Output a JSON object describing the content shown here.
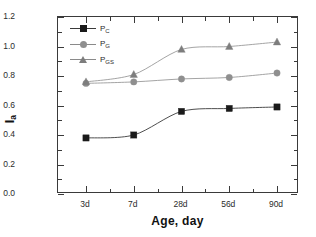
{
  "chart_data": {
    "type": "line",
    "title": "",
    "xlabel": "Age, day",
    "ylabel": "I",
    "ylabel_sub": "a",
    "categories": [
      "3d",
      "7d",
      "28d",
      "56d",
      "90d"
    ],
    "ylim": [
      0.0,
      1.2
    ],
    "ytick_labels": [
      "0.0",
      "0.2",
      "0.4",
      "0.6",
      "0.8",
      "1.0",
      "1.2"
    ],
    "ytick_values": [
      0.0,
      0.2,
      0.4,
      0.6,
      0.8,
      1.0,
      1.2
    ],
    "grid": false,
    "legend_position": "top-left-inside",
    "series": [
      {
        "name": "P",
        "name_sub": "C",
        "marker": "filled-square",
        "color": "#1a1a1a",
        "line_color": "#3a3a3a",
        "values": [
          0.38,
          0.4,
          0.56,
          0.58,
          0.59
        ]
      },
      {
        "name": "P",
        "name_sub": "G",
        "marker": "filled-circle",
        "color": "#8f8f8f",
        "line_color": "#9a9a9a",
        "values": [
          0.75,
          0.76,
          0.78,
          0.79,
          0.82
        ]
      },
      {
        "name": "P",
        "name_sub": "GS",
        "marker": "filled-triangle",
        "color": "#7d7d7d",
        "line_color": "#9a9a9a",
        "values": [
          0.76,
          0.81,
          0.98,
          1.0,
          1.03
        ]
      }
    ]
  },
  "axis": {
    "y_title_main": "I",
    "y_title_sub": "a",
    "x_title": "Age, day"
  },
  "legend": {
    "items": [
      {
        "label_main": "P",
        "label_sub": "C"
      },
      {
        "label_main": "P",
        "label_sub": "G"
      },
      {
        "label_main": "P",
        "label_sub": "GS"
      }
    ]
  },
  "colors": {
    "frame": "#3a3a3a",
    "background": "#ffffff",
    "text": "#1a1a1a",
    "series_pc": "#1a1a1a",
    "series_pg": "#8f8f8f",
    "series_pgs": "#7d7d7d"
  }
}
